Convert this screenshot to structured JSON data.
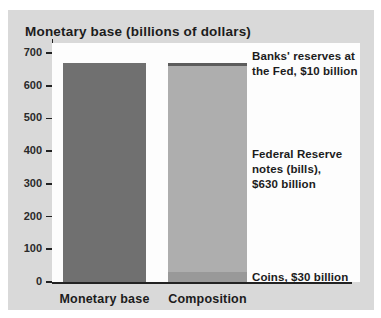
{
  "chart_data": {
    "type": "bar",
    "title": "Monetary base (billions of dollars)",
    "xlabel": "",
    "ylabel": "",
    "ylim": [
      0,
      700
    ],
    "y_ticks": [
      0,
      100,
      200,
      300,
      400,
      500,
      600,
      700
    ],
    "grid": false,
    "legend_position": "none",
    "categories": [
      "Monetary base",
      "Composition"
    ],
    "bars": [
      {
        "label": "Monetary base",
        "total": 670,
        "segments": [
          {
            "name": "monetary-base",
            "value": 670,
            "color": "#707070"
          }
        ]
      },
      {
        "label": "Composition",
        "total": 670,
        "segments": [
          {
            "name": "coins",
            "value": 30,
            "color": "#999999"
          },
          {
            "name": "federal-reserve-notes",
            "value": 630,
            "color": "#aeaeae"
          },
          {
            "name": "banks-reserves",
            "value": 10,
            "color": "#5c5c5c"
          }
        ]
      }
    ],
    "annotations": [
      {
        "target": "banks-reserves",
        "text": "Banks' reserves at\nthe Fed, $10 billion"
      },
      {
        "target": "federal-reserve-notes",
        "text": "Federal Reserve\nnotes (bills),\n$630 billion"
      },
      {
        "target": "coins",
        "text": "Coins, $30 billion"
      }
    ]
  },
  "colors": {
    "panel_background": "#d9d9d9",
    "plot_background": "#fdfdfd",
    "axis": "#222222",
    "text": "#1c1c1c"
  }
}
